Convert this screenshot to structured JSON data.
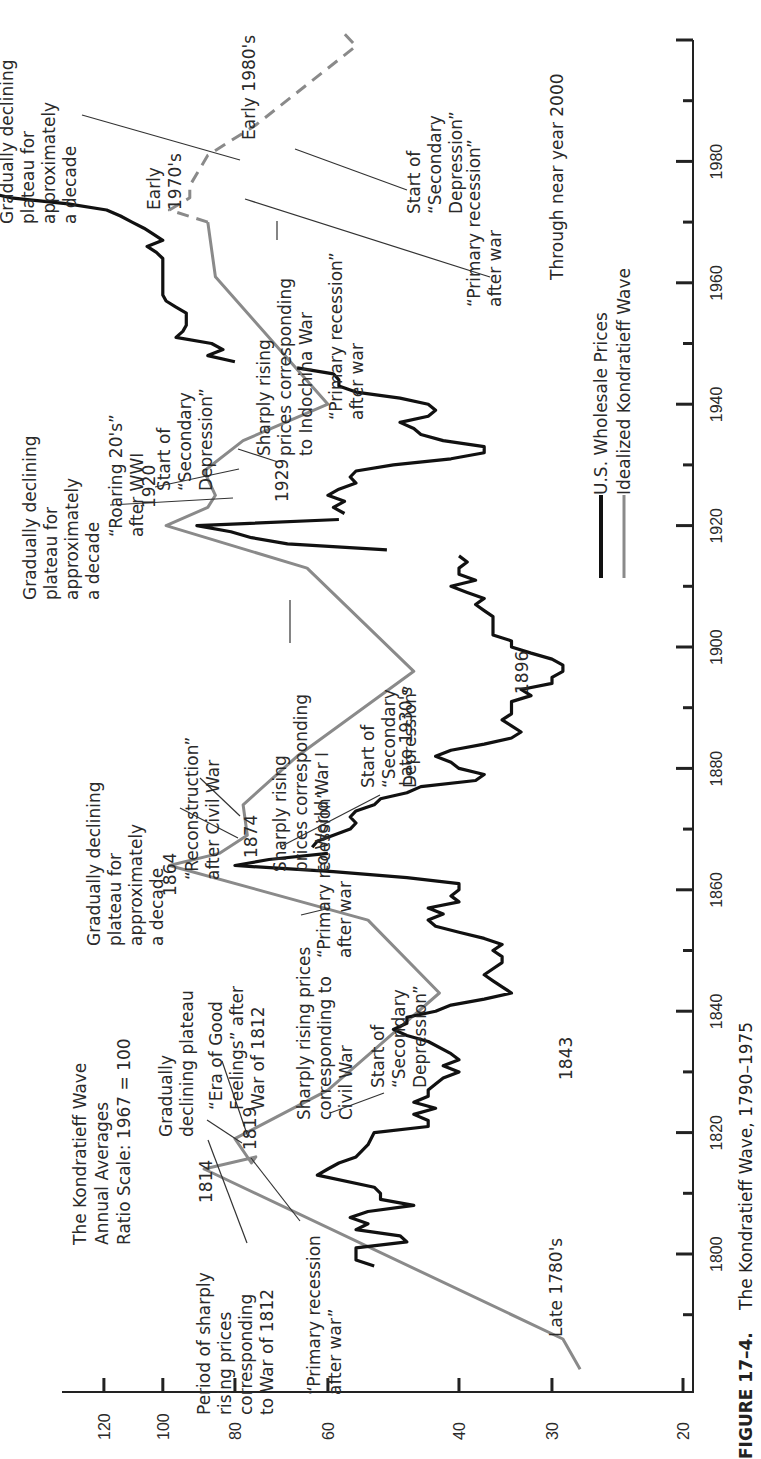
{
  "chart_data": {
    "type": "line",
    "orientation": "rotated-90-ccw",
    "title": "The Kondratieff Wave, 1790–1975",
    "figure_label": "FIGURE 17–4.",
    "subtitle_lines": [
      "The Kondratieff Wave",
      "Annual Averages",
      "Ratio Scale: 1967  =  100"
    ],
    "xlabel": "Year",
    "ylabel": "Index (1967 = 100, ratio scale)",
    "x_ticks": [
      1790,
      1800,
      1810,
      1820,
      1830,
      1840,
      1850,
      1860,
      1870,
      1880,
      1890,
      1900,
      1910,
      1920,
      1930,
      1940,
      1950,
      1960,
      1970,
      1980,
      1990,
      2000
    ],
    "x_tick_labels": [
      "1800",
      "1820",
      "1840",
      "1860",
      "1880",
      "1900",
      "1920",
      "1940",
      "1960",
      "1980"
    ],
    "y_ticks": [
      20,
      30,
      40,
      60,
      80,
      100,
      120
    ],
    "y_scale": "log",
    "xlim": [
      1780,
      2000
    ],
    "ylim": [
      20,
      130
    ],
    "legend": [
      {
        "label": "U.S. Wholesale Prices",
        "color": "#111111",
        "style": "solid-thick"
      },
      {
        "label": "Idealized Kondratieff Wave",
        "color": "#8a8a8a",
        "style": "solid"
      }
    ],
    "series": [
      {
        "name": "Idealized Kondratieff Wave",
        "color": "#8a8a8a",
        "points": [
          [
            1781,
            27.5
          ],
          [
            1786,
            29
          ],
          [
            1814,
            88
          ],
          [
            1816,
            75
          ],
          [
            1815,
            76
          ],
          [
            1819,
            80
          ],
          [
            1827,
            60
          ],
          [
            1843,
            42.5
          ],
          [
            1855,
            53
          ],
          [
            1864,
            98
          ],
          [
            1866,
            84
          ],
          [
            1869,
            77
          ],
          [
            1874,
            78
          ],
          [
            1882,
            66
          ],
          [
            1896,
            46
          ],
          [
            1913,
            64
          ],
          [
            1920,
            99
          ],
          [
            1923,
            87
          ],
          [
            1925,
            85
          ],
          [
            1929,
            88
          ],
          [
            1934,
            78
          ],
          [
            1940,
            60
          ],
          [
            1961,
            85
          ],
          [
            1970,
            87
          ]
        ]
      },
      {
        "name": "Idealized Kondratieff Wave (projected)",
        "color": "#8a8a8a",
        "dashed": true,
        "points": [
          [
            1970,
            87
          ],
          [
            1972,
            98
          ],
          [
            1974,
            92
          ],
          [
            1976,
            92
          ],
          [
            1981,
            87
          ],
          [
            1986,
            75
          ],
          [
            1999,
            55
          ],
          [
            2001,
            57
          ]
        ]
      },
      {
        "name": "U.S. Wholesale Prices",
        "color": "#111111",
        "points": [
          [
            1798,
            52
          ],
          [
            1799,
            55
          ],
          [
            1801,
            55
          ],
          [
            1802,
            47
          ],
          [
            1803,
            48
          ],
          [
            1804,
            55
          ],
          [
            1805,
            53
          ],
          [
            1806,
            56
          ],
          [
            1807,
            53
          ],
          [
            1808,
            46
          ],
          [
            1809,
            51
          ],
          [
            1810,
            51
          ],
          [
            1811,
            52
          ],
          [
            1813,
            62
          ],
          [
            1814,
            60
          ],
          [
            1815,
            58
          ],
          [
            1816,
            55
          ],
          [
            1818,
            53
          ],
          [
            1820,
            52
          ],
          [
            1821,
            44
          ],
          [
            1822,
            44
          ],
          [
            1823,
            46
          ],
          [
            1824,
            43
          ],
          [
            1825,
            46
          ],
          [
            1826,
            44
          ],
          [
            1827,
            44
          ],
          [
            1828,
            43
          ],
          [
            1829,
            42
          ],
          [
            1830,
            40
          ],
          [
            1831,
            42
          ],
          [
            1832,
            40
          ],
          [
            1833,
            41
          ],
          [
            1835,
            44
          ],
          [
            1836,
            47
          ],
          [
            1837,
            49
          ],
          [
            1838,
            47
          ],
          [
            1839,
            47
          ],
          [
            1840,
            43
          ],
          [
            1841,
            41
          ],
          [
            1842,
            37
          ],
          [
            1843,
            34
          ],
          [
            1844,
            35
          ],
          [
            1845,
            36
          ],
          [
            1846,
            37
          ],
          [
            1847,
            36
          ],
          [
            1848,
            35
          ],
          [
            1849,
            35
          ],
          [
            1850,
            36
          ],
          [
            1851,
            35
          ],
          [
            1852,
            37
          ],
          [
            1853,
            40
          ],
          [
            1854,
            43
          ],
          [
            1855,
            44
          ],
          [
            1856,
            42
          ],
          [
            1857,
            44
          ],
          [
            1858,
            40
          ],
          [
            1859,
            41
          ],
          [
            1860,
            40
          ],
          [
            1861,
            40
          ],
          [
            1862,
            47
          ],
          [
            1863,
            59
          ],
          [
            1864,
            80
          ],
          [
            1865,
            72
          ],
          [
            1866,
            60
          ]
        ]
      },
      {
        "name": "U.S. Wholesale Prices (1867-1915)",
        "color": "#111111",
        "points": [
          [
            1867,
            63
          ],
          [
            1868,
            62
          ],
          [
            1869,
            59
          ],
          [
            1870,
            56
          ],
          [
            1871,
            55
          ],
          [
            1872,
            56
          ],
          [
            1873,
            55
          ],
          [
            1874,
            52
          ],
          [
            1875,
            51
          ],
          [
            1876,
            47
          ],
          [
            1877,
            45
          ],
          [
            1878,
            38
          ],
          [
            1879,
            37
          ],
          [
            1880,
            40
          ],
          [
            1881,
            41
          ],
          [
            1882,
            43
          ],
          [
            1883,
            41
          ],
          [
            1884,
            37
          ],
          [
            1885,
            34
          ],
          [
            1886,
            33
          ],
          [
            1887,
            34
          ],
          [
            1888,
            35
          ],
          [
            1889,
            34
          ],
          [
            1890,
            34
          ],
          [
            1891,
            34
          ],
          [
            1892,
            32
          ],
          [
            1893,
            33
          ],
          [
            1894,
            30
          ],
          [
            1895,
            30
          ],
          [
            1896,
            29
          ],
          [
            1897,
            29
          ],
          [
            1898,
            30
          ],
          [
            1899,
            32
          ],
          [
            1900,
            34
          ],
          [
            1901,
            34
          ],
          [
            1902,
            36
          ],
          [
            1903,
            36
          ],
          [
            1904,
            36
          ],
          [
            1905,
            36
          ],
          [
            1906,
            37
          ],
          [
            1907,
            38
          ],
          [
            1908,
            37
          ],
          [
            1909,
            39
          ],
          [
            1910,
            41
          ],
          [
            1911,
            38
          ],
          [
            1912,
            40
          ],
          [
            1913,
            40
          ],
          [
            1914,
            39
          ],
          [
            1915,
            40
          ]
        ]
      },
      {
        "name": "U.S. Wholesale Prices (1916-1921)",
        "color": "#111111",
        "points": [
          [
            1916,
            50
          ],
          [
            1917,
            68
          ],
          [
            1918,
            76
          ],
          [
            1919,
            81
          ],
          [
            1920,
            90
          ],
          [
            1921,
            58
          ]
        ]
      },
      {
        "name": "U.S. Wholesale Prices (1922-1946)",
        "color": "#111111",
        "points": [
          [
            1922,
            57
          ],
          [
            1923,
            59
          ],
          [
            1924,
            57
          ],
          [
            1925,
            60
          ],
          [
            1926,
            58
          ],
          [
            1927,
            55
          ],
          [
            1928,
            56
          ],
          [
            1929,
            55
          ],
          [
            1930,
            49
          ],
          [
            1931,
            41
          ],
          [
            1932,
            37
          ],
          [
            1933,
            37
          ],
          [
            1934,
            42
          ],
          [
            1935,
            45
          ],
          [
            1936,
            46
          ],
          [
            1937,
            48
          ],
          [
            1938,
            44
          ],
          [
            1939,
            43
          ],
          [
            1940,
            44
          ],
          [
            1941,
            48
          ],
          [
            1942,
            55
          ],
          [
            1943,
            58
          ],
          [
            1944,
            58
          ],
          [
            1945,
            59
          ],
          [
            1946,
            66
          ]
        ]
      },
      {
        "name": "U.S. Wholesale Prices (1947-1975)",
        "color": "#111111",
        "points": [
          [
            1947,
            80
          ],
          [
            1948,
            87
          ],
          [
            1949,
            83
          ],
          [
            1950,
            86
          ],
          [
            1951,
            96
          ],
          [
            1952,
            94
          ],
          [
            1953,
            93
          ],
          [
            1954,
            93
          ],
          [
            1955,
            93
          ],
          [
            1956,
            96
          ],
          [
            1957,
            99
          ],
          [
            1958,
            100
          ],
          [
            1959,
            100
          ],
          [
            1960,
            100
          ],
          [
            1961,
            100
          ],
          [
            1962,
            100
          ],
          [
            1963,
            100
          ],
          [
            1964,
            100
          ],
          [
            1965,
            102
          ],
          [
            1966,
            105
          ],
          [
            1967,
            100
          ],
          [
            1968,
            103
          ],
          [
            1969,
            106
          ],
          [
            1970,
            110
          ],
          [
            1971,
            114
          ],
          [
            1972,
            119
          ],
          [
            1973,
            134
          ],
          [
            1974,
            160
          ],
          [
            1975,
            174
          ]
        ]
      }
    ],
    "annotations": [
      {
        "text": [
          "Late 1780's"
        ],
        "year": 1786
      },
      {
        "text": [
          "1814"
        ],
        "year": 1814
      },
      {
        "text": [
          "1819"
        ],
        "year": 1819
      },
      {
        "text": [
          "1843"
        ],
        "year": 1843
      },
      {
        "text": [
          "1864"
        ],
        "year": 1864
      },
      {
        "text": [
          "1874"
        ],
        "year": 1874
      },
      {
        "text": [
          "1896"
        ],
        "year": 1896
      },
      {
        "text": [
          "1920"
        ],
        "year": 1920
      },
      {
        "text": [
          "1929"
        ],
        "year": 1929
      },
      {
        "text": [
          "Period of sharply",
          "rising prices",
          "corresponding",
          "to War of 1812"
        ]
      },
      {
        "text": [
          "''Primary recession",
          "after war''"
        ]
      },
      {
        "text": [
          "Gradually",
          "declining plateau"
        ]
      },
      {
        "text": [
          "''Era of Good",
          "Feelings'' after",
          "War of 1812"
        ]
      },
      {
        "text": [
          "Sharply rising prices",
          "corresponding to",
          "Civil War"
        ]
      },
      {
        "text": [
          "Start of",
          "''Secondary",
          "Depression''"
        ]
      },
      {
        "text": [
          "''Primary recession''",
          "after war"
        ]
      },
      {
        "text": [
          "Gradually declining",
          "plateau for",
          "approximately",
          "a decade"
        ]
      },
      {
        "text": [
          "''Reconstruction''",
          "after Civil War"
        ]
      },
      {
        "text": [
          "Sharply rising",
          "prices corresponding",
          "to World War I"
        ]
      },
      {
        "text": [
          "Start of",
          "''Secondary",
          "Depression''"
        ]
      },
      {
        "text": [
          "Late 1930's"
        ]
      },
      {
        "text": [
          "Gradually declining",
          "plateau for",
          "approximately",
          "a decade"
        ]
      },
      {
        "text": [
          "''Roaring 20's''",
          "after WWI"
        ]
      },
      {
        "text": [
          "Start of",
          "''Secondary",
          "Depression''"
        ]
      },
      {
        "text": [
          "Sharply rising",
          "prices corresponding",
          "to Indochina War"
        ]
      },
      {
        "text": [
          "''Primary recession''",
          "after war"
        ]
      },
      {
        "text": [
          "Gradually declining",
          "plateau for",
          "approximately",
          "a decade"
        ]
      },
      {
        "text": [
          "Early",
          "1970's"
        ]
      },
      {
        "text": [
          "Early 1980's"
        ]
      },
      {
        "text": [
          "Start of",
          "''Secondary",
          "Depression''"
        ]
      },
      {
        "text": [
          "''Primary recession''",
          "after war"
        ]
      },
      {
        "text": [
          "Through near year 2000"
        ]
      }
    ]
  },
  "labels": {
    "header_line1": "The Kondratieff Wave",
    "header_line2": "Annual Averages",
    "header_line3": "Ratio Scale: 1967  =  100",
    "caption_fig": "FIGURE 17–4.",
    "caption_title": "The Kondratieff Wave, 1790–1975",
    "legend_wholesale": "U.S. Wholesale Prices",
    "legend_idealized": "Idealized Kondratieff Wave"
  }
}
